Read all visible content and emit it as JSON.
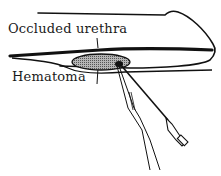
{
  "diagram": {
    "labels": {
      "occluded_urethra": "Occluded urethra",
      "hematoma": "Hematoma"
    },
    "colors": {
      "ink": "#111111",
      "hematoma_fill": "#8a8a8a",
      "background": "#ffffff"
    },
    "elements": [
      "penile-shaft-outline",
      "urethra-line",
      "hematoma-ellipse",
      "aspiration-needle",
      "surgical-instrument"
    ]
  }
}
